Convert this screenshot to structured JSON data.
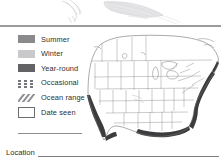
{
  "illustration": {
    "name": "bird-wing-illustration",
    "description": "faint pencil sketch of bird wing and tail feathers"
  },
  "legend": {
    "title": "Range map legend",
    "items": [
      {
        "label": "Summer",
        "symbol": "filled-swatch",
        "color": "#8a8a8d",
        "icon": "summer-swatch-icon"
      },
      {
        "label": "Winter",
        "symbol": "filled-swatch",
        "color": "#c9c9cb",
        "icon": "winter-swatch-icon"
      },
      {
        "label": "Year-round",
        "symbol": "filled-swatch",
        "color": "#636366",
        "icon": "year-round-swatch-icon"
      },
      {
        "label": "Occasional",
        "symbol": "dotted-pattern",
        "color": "#76767a",
        "icon": "occasional-dots-icon"
      },
      {
        "label": "Ocean range",
        "symbol": "diagonal-hatch",
        "color": "#8f8f93",
        "icon": "ocean-range-hatch-icon"
      },
      {
        "label": "Date seen",
        "symbol": "empty-box",
        "color": "#6d6d70",
        "icon": "date-seen-box-icon"
      }
    ]
  },
  "map": {
    "name": "north-america-range-map",
    "region": "United States and southern Canada",
    "coastal_range_color": "#3a3a3c",
    "outline_color": "#6f6f73"
  },
  "footer": {
    "location_label": "Location"
  }
}
